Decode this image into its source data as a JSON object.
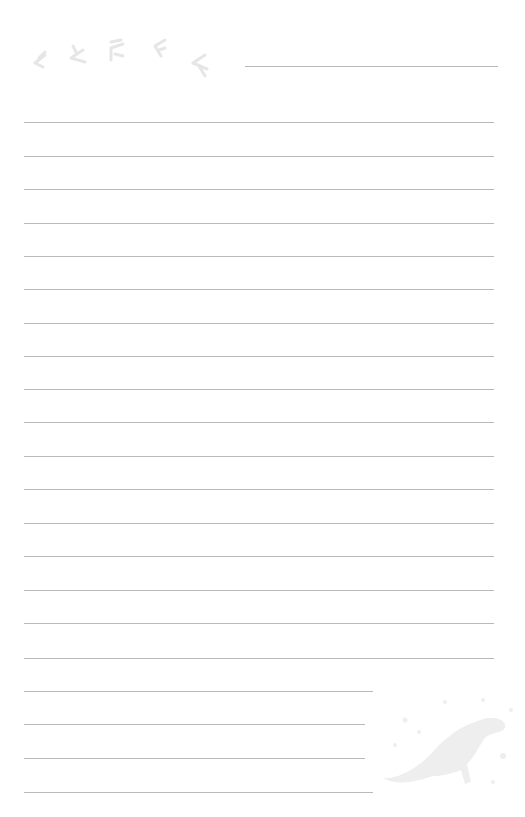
{
  "page": {
    "type": "lined-stationery",
    "background": "#ffffff",
    "line_color": "#b9b9b9",
    "decoration_color": "#ececec"
  },
  "header_line": {
    "x1": 245,
    "x2": 498,
    "y": 66
  },
  "lines": [
    {
      "y": 122,
      "x1": 24,
      "x2": 494
    },
    {
      "y": 156,
      "x1": 24,
      "x2": 494
    },
    {
      "y": 189,
      "x1": 24,
      "x2": 494
    },
    {
      "y": 223,
      "x1": 24,
      "x2": 494
    },
    {
      "y": 256,
      "x1": 24,
      "x2": 494
    },
    {
      "y": 289,
      "x1": 24,
      "x2": 494
    },
    {
      "y": 323,
      "x1": 24,
      "x2": 494
    },
    {
      "y": 356,
      "x1": 24,
      "x2": 494
    },
    {
      "y": 389,
      "x1": 24,
      "x2": 494
    },
    {
      "y": 422,
      "x1": 24,
      "x2": 494
    },
    {
      "y": 456,
      "x1": 24,
      "x2": 494
    },
    {
      "y": 489,
      "x1": 24,
      "x2": 494
    },
    {
      "y": 523,
      "x1": 24,
      "x2": 494
    },
    {
      "y": 556,
      "x1": 24,
      "x2": 494
    },
    {
      "y": 590,
      "x1": 24,
      "x2": 494
    },
    {
      "y": 623,
      "x1": 24,
      "x2": 494
    },
    {
      "y": 658,
      "x1": 24,
      "x2": 494
    },
    {
      "y": 691,
      "x1": 24,
      "x2": 373
    },
    {
      "y": 724,
      "x1": 24,
      "x2": 365
    },
    {
      "y": 758,
      "x1": 24,
      "x2": 365
    },
    {
      "y": 792,
      "x1": 24,
      "x2": 373
    }
  ],
  "decorations": {
    "top_left": "birds-icon",
    "bottom_right": "dinosaur-icon"
  }
}
